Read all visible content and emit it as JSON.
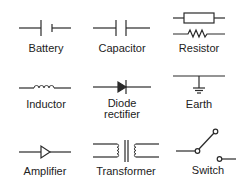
{
  "colors": {
    "stroke": "#2a2a2a",
    "background": "#ffffff"
  },
  "symbols": [
    {
      "id": "battery",
      "label": "Battery"
    },
    {
      "id": "capacitor",
      "label": "Capacitor"
    },
    {
      "id": "resistor",
      "label": "Resistor"
    },
    {
      "id": "inductor",
      "label": "Inductor"
    },
    {
      "id": "diode",
      "label_line1": "Diode",
      "label_line2": "rectifier"
    },
    {
      "id": "earth",
      "label": "Earth"
    },
    {
      "id": "amplifier",
      "label": "Amplifier"
    },
    {
      "id": "transformer",
      "label": "Transformer"
    },
    {
      "id": "switch",
      "label": "Switch"
    }
  ]
}
